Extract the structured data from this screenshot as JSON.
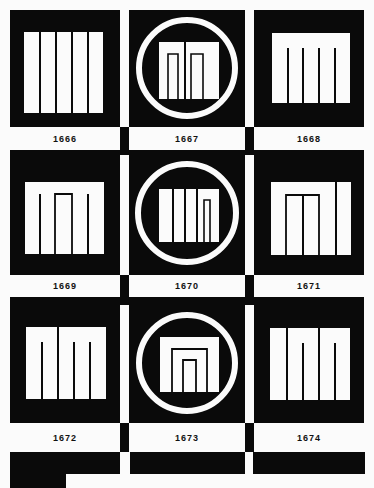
{
  "sheet": {
    "background": "#fbfbfb",
    "ink": "#0a0a0a",
    "cells": [
      {
        "id": "1666",
        "label": "1666",
        "circle": false
      },
      {
        "id": "1667",
        "label": "1667",
        "circle": true
      },
      {
        "id": "1668",
        "label": "1668",
        "circle": false
      },
      {
        "id": "1669",
        "label": "1669",
        "circle": false
      },
      {
        "id": "1670",
        "label": "1670",
        "circle": true
      },
      {
        "id": "1671",
        "label": "1671",
        "circle": false
      },
      {
        "id": "1672",
        "label": "1672",
        "circle": false
      },
      {
        "id": "1673",
        "label": "1673",
        "circle": true
      },
      {
        "id": "1674",
        "label": "1674",
        "circle": false
      }
    ]
  }
}
